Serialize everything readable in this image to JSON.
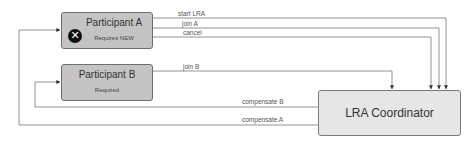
{
  "diagram": {
    "nodes": {
      "participant_a": {
        "title": "Participant A",
        "subtitle": "Requires NEW",
        "icon": "x-circle-icon"
      },
      "participant_b": {
        "title": "Participant B",
        "subtitle": "Required"
      },
      "coordinator": {
        "title": "LRA Coordinator"
      }
    },
    "edges": {
      "start_lra": {
        "label": "start LRA",
        "from": "Participant A",
        "to": "LRA Coordinator"
      },
      "join_a": {
        "label": "join A",
        "from": "Participant A",
        "to": "LRA Coordinator"
      },
      "cancel": {
        "label": "cancel",
        "from": "Participant A",
        "to": "LRA Coordinator"
      },
      "join_b": {
        "label": "join B",
        "from": "Participant B",
        "to": "LRA Coordinator"
      },
      "compensate_b": {
        "label": "compensate B",
        "from": "LRA Coordinator",
        "to": "Participant B"
      },
      "compensate_a": {
        "label": "compensate A",
        "from": "LRA Coordinator",
        "to": "Participant A"
      }
    },
    "colors": {
      "participant_fill": "#c4c4c4",
      "coordinator_fill": "#e6e6e6",
      "line": "#666666",
      "icon": "#111111"
    }
  }
}
